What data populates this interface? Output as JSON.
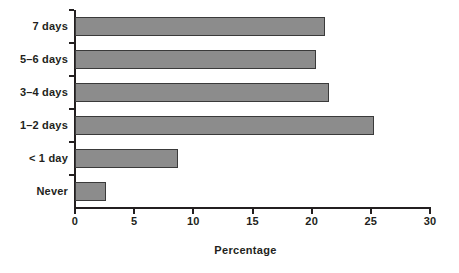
{
  "chart_data": {
    "type": "bar",
    "orientation": "horizontal",
    "title": "",
    "subtitle": "",
    "xlabel": "Percentage",
    "ylabel": "",
    "categories": [
      "Never",
      "< 1 day",
      "1–2 days",
      "3–4 days",
      "5–6 days",
      "7 days"
    ],
    "values": [
      2.6,
      8.7,
      25.3,
      21.5,
      20.4,
      21.1
    ],
    "xlim": [
      0,
      30
    ],
    "xticks": [
      0,
      5,
      10,
      15,
      20,
      25,
      30
    ],
    "xtick_labels": [
      "0",
      "5",
      "10",
      "15",
      "20",
      "25",
      "30"
    ],
    "grid": false,
    "legend": false,
    "legend_position": "none",
    "bar_fill_color": "#8c8c8c",
    "bar_edge_color": "#3a3a3a",
    "axis_color": "#231f20",
    "background_color": "#ffffff"
  },
  "axis": {
    "x_title": "Percentage"
  }
}
